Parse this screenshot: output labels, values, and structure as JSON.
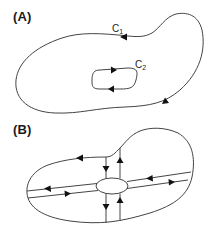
{
  "figure": {
    "panels": [
      {
        "id": "A",
        "label": "(A)",
        "curves": [
          {
            "name": "C1",
            "label_main": "C",
            "label_sub": "1",
            "description": "outer closed contour, counter-clockwise"
          },
          {
            "name": "C2",
            "label_main": "C",
            "label_sub": "2",
            "description": "inner closed contour, clockwise"
          }
        ]
      },
      {
        "id": "B",
        "label": "(B)",
        "description": "region cut by two pairs of parallel lines connecting outer boundary to inner hole"
      }
    ]
  },
  "colors": {
    "stroke": "#444444",
    "arrow": "#111111",
    "text": "#1a1a1a",
    "background": "#ffffff"
  }
}
